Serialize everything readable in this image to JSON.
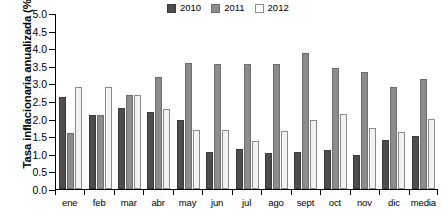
{
  "chart_data": {
    "type": "bar",
    "title": "",
    "xlabel": "",
    "ylabel": "Tasa inflacionaria anualizada (%)",
    "ylim": [
      0.0,
      5.0
    ],
    "ytick_step": 0.5,
    "yticks": [
      "5.0",
      "4.5",
      "4.0",
      "3.5",
      "3.0",
      "2.5",
      "2.0",
      "1.5",
      "1.0",
      "0.5",
      "0.0"
    ],
    "grid": false,
    "legend_position": "top-center",
    "categories": [
      "ene",
      "feb",
      "mar",
      "abr",
      "may",
      "jun",
      "jul",
      "ago",
      "sept",
      "oct",
      "nov",
      "dic",
      "media"
    ],
    "series": [
      {
        "name": "2010",
        "color": "#4d4d4d",
        "values": [
          2.6,
          2.1,
          2.3,
          2.18,
          1.97,
          1.05,
          1.15,
          1.03,
          1.05,
          1.12,
          0.98,
          1.4,
          1.5
        ]
      },
      {
        "name": "2011",
        "color": "#8c8c8c",
        "values": [
          1.6,
          2.1,
          2.68,
          3.18,
          3.57,
          3.56,
          3.56,
          3.55,
          3.85,
          3.45,
          3.33,
          2.9,
          3.12
        ]
      },
      {
        "name": "2012",
        "color": "#ffffff",
        "values": [
          2.9,
          2.9,
          2.68,
          2.28,
          1.67,
          1.67,
          1.35,
          1.65,
          1.97,
          2.12,
          1.72,
          1.62,
          2.0
        ]
      }
    ]
  },
  "legend": {
    "items": [
      {
        "label": "2010",
        "key": "y2010"
      },
      {
        "label": "2011",
        "key": "y2011"
      },
      {
        "label": "2012",
        "key": "y2012"
      }
    ]
  }
}
